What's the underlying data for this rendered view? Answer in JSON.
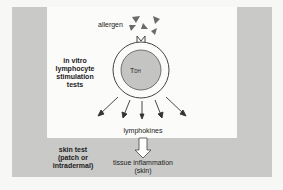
{
  "labels": {
    "allergen": "allergen",
    "cell": "T",
    "cell_sub": "DH",
    "in_vitro": [
      "in vitro",
      "lymphocyte",
      "stimulation",
      "tests"
    ],
    "lymphokines": "lymphokines",
    "skin_test": [
      "skin test",
      "(patch or",
      "intradermal)"
    ],
    "outcome": [
      "tissue inflammation",
      "(skin)"
    ]
  },
  "colors": {
    "frame": "#c9c9c7",
    "panel": "#fbfbfa",
    "cell_nucleus": "#c4c4c2",
    "allergen": "#6a6a6a"
  }
}
